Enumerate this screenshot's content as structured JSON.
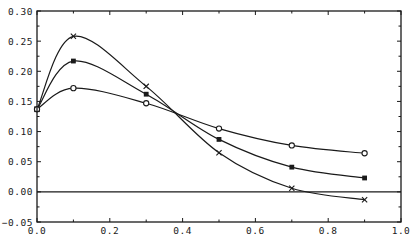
{
  "chart_data": {
    "type": "line",
    "title": "",
    "xlabel": "",
    "ylabel": "",
    "xlim": [
      0.0,
      1.0
    ],
    "ylim": [
      -0.05,
      0.3
    ],
    "grid": false,
    "legend": null,
    "x_ticks": [
      "0.0",
      "0.2",
      "0.4",
      "0.6",
      "0.8",
      "1.0"
    ],
    "y_ticks": [
      "-0.05",
      "0.00",
      "0.05",
      "0.10",
      "0.15",
      "0.20",
      "0.25",
      "0.30"
    ],
    "reference_line": {
      "y": 0.0
    },
    "x": [
      0.0,
      0.1,
      0.3,
      0.5,
      0.7,
      0.9
    ],
    "series": [
      {
        "name": "cross",
        "marker": "x",
        "values": [
          0.137,
          0.258,
          0.175,
          0.065,
          0.006,
          -0.013
        ]
      },
      {
        "name": "square",
        "marker": "filled-square",
        "values": [
          0.137,
          0.217,
          0.162,
          0.087,
          0.041,
          0.023
        ]
      },
      {
        "name": "circle",
        "marker": "open-circle",
        "values": [
          0.137,
          0.172,
          0.147,
          0.105,
          0.077,
          0.064
        ]
      }
    ]
  }
}
